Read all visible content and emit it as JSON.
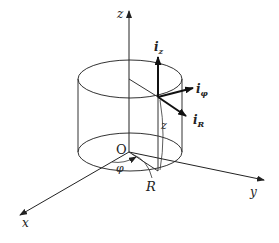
{
  "diagram": {
    "axes": {
      "x": "x",
      "y": "y",
      "z": "z"
    },
    "origin": "O",
    "coordinates": {
      "radius": "R",
      "angle": "φ",
      "height": "z"
    },
    "unit_vectors": [
      {
        "symbol": "i",
        "subscript": "z"
      },
      {
        "symbol": "i",
        "subscript": "φ"
      },
      {
        "symbol": "i",
        "subscript": "R"
      }
    ],
    "colors": {
      "line": "#222222",
      "background": "#ffffff"
    }
  }
}
